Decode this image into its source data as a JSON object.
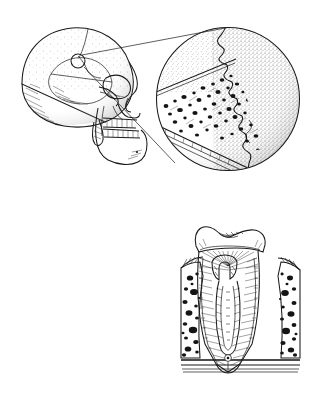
{
  "figure": {
    "kind": "anatomical-line-illustration",
    "medium": "pen-and-ink stipple and hatch drawing",
    "palette": {
      "ink": "#1a1a1a",
      "ink_dark": "#111111",
      "background": "#ffffff"
    },
    "canvas": {
      "width": 316,
      "height": 405
    },
    "has_text_labels": false,
    "panels": [
      {
        "id": "panel-skull",
        "name": "lateral-skull-with-magnified-suture",
        "region": {
          "x": 10,
          "y": 22,
          "width": 296,
          "height": 158
        },
        "subject": "human skull, left lateral view, with circular magnification callout",
        "parts": [
          "cranial vault",
          "frontal bone",
          "parietal bone",
          "temporal bone",
          "occipital bone",
          "mastoid process",
          "zygomatic arch",
          "orbit",
          "nasal aperture",
          "maxilla",
          "maxillary teeth",
          "mandible",
          "mandibular teeth",
          "mental protuberance"
        ],
        "callout": {
          "name": "magnifier-callout",
          "source_marker": {
            "cx": 78,
            "cy": 61,
            "r": 7
          },
          "source_site": "pterion / coronal suture region",
          "target_circle": {
            "cx": 228,
            "cy": 99,
            "r": 72
          },
          "leader_lines": 2
        }
      },
      {
        "id": "panel-magnified-suture",
        "name": "magnified-cranial-suture-and-diploe",
        "region": {
          "x": 156,
          "y": 27,
          "width": 144,
          "height": 145
        },
        "subject": "high magnification of a cranial suture through the skull wall",
        "parts": [
          "serrated interdigitating suture line",
          "stippled outer bone surface",
          "outer cortical table",
          "diploe with cancellous marrow spaces",
          "inner cortical table"
        ]
      },
      {
        "id": "panel-tooth",
        "name": "tooth-longitudinal-section",
        "region": {
          "x": 176,
          "y": 222,
          "width": 128,
          "height": 168
        },
        "subject": "longitudinal section of a tooth seated in alveolar bone",
        "parts": [
          "enamel cap",
          "crown",
          "dentin with radiating tubules",
          "pulp chamber",
          "pulp horns",
          "root canal",
          "apical foramen",
          "cementum",
          "periodontal ligament",
          "gingiva",
          "alveolar bone with marrow spaces",
          "cortical bone base"
        ]
      }
    ]
  }
}
